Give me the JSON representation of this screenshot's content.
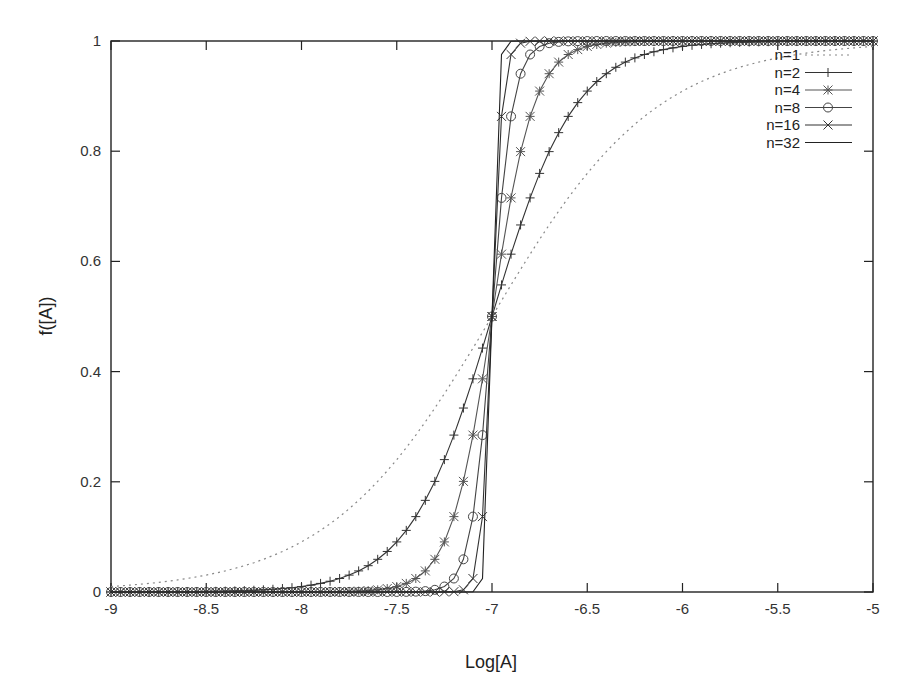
{
  "chart_data": {
    "type": "line",
    "title": "",
    "xlabel": "Log[A]",
    "ylabel": "f([A])",
    "xlim": [
      -9,
      -5
    ],
    "ylim": [
      0,
      1
    ],
    "xticks": [
      "-9",
      "-8.5",
      "-8",
      "-7.5",
      "-7",
      "-6.5",
      "-6",
      "-5.5",
      "-5"
    ],
    "yticks": [
      "0",
      "0.2",
      "0.4",
      "0.6",
      "0.8",
      "1"
    ],
    "grid": false,
    "legend_position": "top-right",
    "function": "f = 1 / (1 + 10^(n * (-7 - x)))",
    "x_step": 0.05,
    "x": [
      -9,
      -8.95,
      -8.9,
      -8.85,
      -8.8,
      -8.75,
      -8.7,
      -8.65,
      -8.6,
      -8.55,
      -8.5,
      -8.45,
      -8.4,
      -8.35,
      -8.3,
      -8.25,
      -8.2,
      -8.15,
      -8.1,
      -8.05,
      -8,
      -7.95,
      -7.9,
      -7.85,
      -7.8,
      -7.75,
      -7.7,
      -7.65,
      -7.6,
      -7.55,
      -7.5,
      -7.45,
      -7.4,
      -7.35,
      -7.3,
      -7.25,
      -7.2,
      -7.15,
      -7.1,
      -7.05,
      -7,
      -6.95,
      -6.9,
      -6.85,
      -6.8,
      -6.75,
      -6.7,
      -6.65,
      -6.6,
      -6.55,
      -6.5,
      -6.45,
      -6.4,
      -6.35,
      -6.3,
      -6.25,
      -6.2,
      -6.15,
      -6.1,
      -6.05,
      -6,
      -5.95,
      -5.9,
      -5.85,
      -5.8,
      -5.75,
      -5.7,
      -5.65,
      -5.6,
      -5.55,
      -5.5,
      -5.45,
      -5.4,
      -5.35,
      -5.3,
      -5.25,
      -5.2,
      -5.15,
      -5.1,
      -5.05,
      -5
    ],
    "series": [
      {
        "name": "n=1",
        "n": 1,
        "style": "dotted",
        "marker": "none",
        "color": "#888888"
      },
      {
        "name": "n=2",
        "n": 2,
        "style": "solid",
        "marker": "plus",
        "color": "#333333"
      },
      {
        "name": "n=4",
        "n": 4,
        "style": "solid",
        "marker": "star",
        "color": "#555555"
      },
      {
        "name": "n=8",
        "n": 8,
        "style": "solid",
        "marker": "circle",
        "color": "#444444"
      },
      {
        "name": "n=16",
        "n": 16,
        "style": "solid",
        "marker": "cross",
        "color": "#333333"
      },
      {
        "name": "n=32",
        "n": 32,
        "style": "solid",
        "marker": "none",
        "color": "#222222"
      }
    ],
    "key_points": {
      "midpoint": {
        "x": -7,
        "y": 0.5
      },
      "n=1_at_-8": 0.0909,
      "n=1_at_-6": 0.9091,
      "n=2_at_-7.5": 0.0909,
      "n=2_at_-6.5": 0.9091,
      "n=4_at_-7.25": 0.0909,
      "n=4_at_-6.75": 0.9091,
      "n=8_at_-7.1": 0.1368,
      "n=8_at_-6.9": 0.8632
    }
  },
  "legend": {
    "items": [
      "n=1",
      "n=2",
      "n=4",
      "n=8",
      "n=16",
      "n=32"
    ]
  }
}
